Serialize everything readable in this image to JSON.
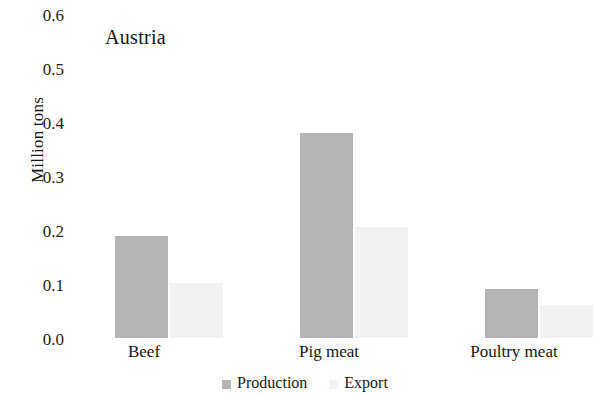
{
  "chart_data": {
    "type": "bar",
    "title": "Austria",
    "xlabel": "",
    "ylabel": "Million tons",
    "categories": [
      "Beef",
      "Pig meat",
      "Poultry meat"
    ],
    "series": [
      {
        "name": "Production",
        "values": [
          0.217,
          0.437,
          0.105
        ],
        "color": "#b4b4b4"
      },
      {
        "name": "Export",
        "values": [
          0.117,
          0.237,
          0.07
        ],
        "color": "#f2f2f2"
      }
    ],
    "ylim": [
      0.0,
      0.6
    ],
    "ytick_labels": [
      "0.6",
      "0.5",
      "0.4",
      "0.3",
      "0.2",
      "0.1",
      "0.0"
    ],
    "ytick_values": [
      0.6,
      0.5,
      0.4,
      0.3,
      0.2,
      0.1,
      0.0
    ],
    "grid": false,
    "legend_position": "bottom",
    "legend_entries": [
      "Production",
      "Export"
    ]
  }
}
